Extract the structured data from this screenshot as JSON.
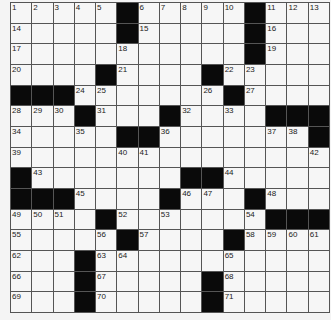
{
  "puzzle": {
    "rows": 15,
    "cols": 15,
    "grid": [
      [
        "1",
        "2",
        "3",
        "4",
        "5",
        "#",
        "6",
        "7",
        "8",
        "9",
        "10",
        "#",
        "11",
        "12",
        "13"
      ],
      [
        "14",
        "",
        "",
        "",
        "",
        "#",
        "15",
        "",
        "",
        "",
        "",
        "#",
        "16",
        "",
        ""
      ],
      [
        "17",
        "",
        "",
        "",
        "",
        "18",
        "",
        "",
        "",
        "",
        "",
        "#",
        "19",
        "",
        ""
      ],
      [
        "20",
        "",
        "",
        "",
        "#",
        "21",
        "",
        "",
        "",
        "#",
        "22",
        "23",
        "",
        "",
        ""
      ],
      [
        "#",
        "#",
        "#",
        "24",
        "25",
        "",
        "",
        "",
        "",
        "26",
        "#",
        "27",
        "",
        "",
        ""
      ],
      [
        "28",
        "29",
        "30",
        "#",
        "31",
        "",
        "",
        "#",
        "32",
        "",
        "33",
        "",
        "#",
        "#",
        "#"
      ],
      [
        "34",
        "",
        "",
        "35",
        "",
        "#",
        "#",
        "36",
        "",
        "",
        "",
        "",
        "37",
        "38",
        "#"
      ],
      [
        "39",
        "",
        "",
        "",
        "",
        "40",
        "41",
        "",
        "",
        "",
        "",
        "",
        "",
        "",
        "42"
      ],
      [
        "#",
        "43",
        "",
        "",
        "",
        "",
        "",
        "",
        "#",
        "#",
        "44",
        "",
        "",
        "",
        ""
      ],
      [
        "#",
        "#",
        "#",
        "45",
        "",
        "",
        "",
        "#",
        "46",
        "47",
        "",
        "#",
        "48",
        "",
        ""
      ],
      [
        "49",
        "50",
        "51",
        "",
        "#",
        "52",
        "",
        "53",
        "",
        "",
        "",
        "54",
        "#",
        "#",
        "#"
      ],
      [
        "55",
        "",
        "",
        "",
        "56",
        "#",
        "57",
        "",
        "",
        "",
        "#",
        "58",
        "59",
        "60",
        "61"
      ],
      [
        "62",
        "",
        "",
        "#",
        "63",
        "64",
        "",
        "",
        "",
        "",
        "65",
        "",
        "",
        "",
        ""
      ],
      [
        "66",
        "",
        "",
        "#",
        "67",
        "",
        "",
        "",
        "",
        "#",
        "68",
        "",
        "",
        "",
        ""
      ],
      [
        "69",
        "",
        "",
        "#",
        "70",
        "",
        "",
        "",
        "",
        "#",
        "71",
        "",
        "",
        "",
        ""
      ]
    ]
  },
  "colors": {
    "block": "#0a0a0a",
    "cell": "#f6f6f6",
    "gridline": "#555555"
  }
}
